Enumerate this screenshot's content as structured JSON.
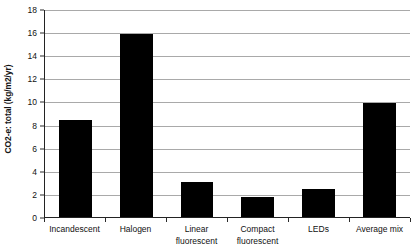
{
  "chart_data": {
    "type": "bar",
    "title": "",
    "xlabel": "",
    "ylabel": "CO2-e: total (kg/m2/yr)",
    "categories": [
      "Incandescent",
      "Halogen",
      "Linear fluorescent",
      "Compact fluorescent",
      "LEDs",
      "Average mix"
    ],
    "category_lines": [
      [
        "Incandescent"
      ],
      [
        "Halogen"
      ],
      [
        "Linear",
        "fluorescent"
      ],
      [
        "Compact",
        "fluorescent"
      ],
      [
        "LEDs"
      ],
      [
        "Average mix"
      ]
    ],
    "values": [
      8.4,
      15.9,
      3.05,
      1.7,
      2.45,
      9.9
    ],
    "ylim": [
      0,
      18
    ],
    "ytick_step": 2,
    "yticks": [
      0,
      2,
      4,
      6,
      8,
      10,
      12,
      14,
      16,
      18
    ],
    "ytick_labels": [
      "0",
      "2",
      "4",
      "6",
      "8",
      "10",
      "12",
      "14",
      "16",
      "18"
    ],
    "grid": true,
    "grid_axis": "y",
    "legend": false,
    "legend_position": "none",
    "series": [
      {
        "name": "CO2-e total",
        "values": [
          8.4,
          15.9,
          3.05,
          1.7,
          2.45,
          9.9
        ],
        "color": "#000000"
      }
    ],
    "colors": {
      "bar": "#000000",
      "grid": "#a9a9a9",
      "axis": "#232323",
      "text": "#111111",
      "background": "#ffffff"
    }
  }
}
